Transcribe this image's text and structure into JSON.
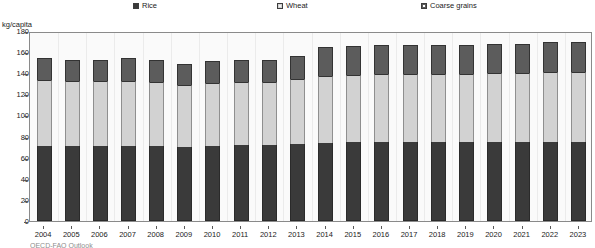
{
  "legend": {
    "items": [
      {
        "label": "Rice",
        "icon": "filled-square-icon",
        "color": "#3a3a3a",
        "x": 133
      },
      {
        "label": "Wheat",
        "icon": "open-square-icon",
        "color": "#d2d2d2",
        "x": 277
      },
      {
        "label": "Coarse grains",
        "icon": "half-filled-square-icon",
        "color": "#5c5c5c",
        "x": 421
      }
    ]
  },
  "axis": {
    "unit_label": "kg/capita"
  },
  "footnote": "OECD-FAO Outlook",
  "chart_data": {
    "type": "bar",
    "subtype": "stacked",
    "title": "",
    "xlabel": "",
    "ylabel": "kg/capita",
    "ylim": [
      0,
      180
    ],
    "ytick_step": 20,
    "yticks": [
      0,
      20,
      40,
      60,
      80,
      100,
      120,
      140,
      160,
      180
    ],
    "grid": false,
    "legend_position": "top",
    "categories": [
      "2004",
      "2005",
      "2006",
      "2007",
      "2008",
      "2009",
      "2010",
      "2011",
      "2012",
      "2013",
      "2014",
      "2015",
      "2016",
      "2017",
      "2018",
      "2019",
      "2020",
      "2021",
      "2022",
      "2023"
    ],
    "series": [
      {
        "name": "Rice",
        "color": "#3a3a3a",
        "values": [
          71,
          71,
          71,
          71,
          71,
          70,
          71,
          72,
          72,
          73,
          74,
          75,
          75,
          75,
          75,
          75,
          75,
          75,
          75,
          75
        ]
      },
      {
        "name": "Wheat",
        "color": "#d2d2d2",
        "values": [
          63,
          62,
          62,
          62,
          61,
          59,
          60,
          60,
          60,
          62,
          63,
          63,
          64,
          64,
          64,
          64,
          65,
          65,
          66,
          66
        ]
      },
      {
        "name": "Coarse grains",
        "color": "#5c5c5c",
        "values": [
          20,
          20,
          20,
          21,
          21,
          20,
          21,
          21,
          21,
          21,
          28,
          28,
          28,
          28,
          28,
          28,
          28,
          28,
          29,
          29
        ]
      }
    ],
    "totals": [
      154,
      153,
      153,
      154,
      153,
      149,
      152,
      153,
      153,
      156,
      165,
      166,
      167,
      167,
      167,
      167,
      168,
      168,
      170,
      170
    ]
  }
}
